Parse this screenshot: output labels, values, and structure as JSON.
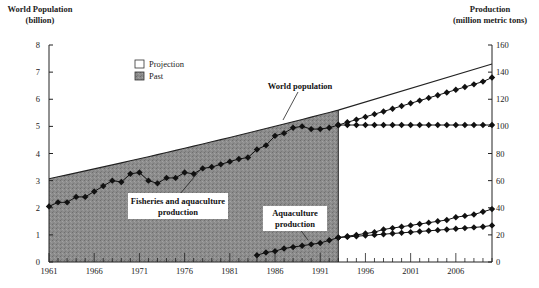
{
  "chart_data": {
    "type": "line",
    "title": "",
    "left_axis": {
      "label_line1": "World Population",
      "label_line2": "(billion)",
      "ticks": [
        "0",
        "1",
        "2",
        "3",
        "4",
        "5",
        "6",
        "7",
        "8"
      ],
      "ylim": [
        0,
        8
      ]
    },
    "right_axis": {
      "label_line1": "Production",
      "label_line2": "(million metric tons)",
      "ticks": [
        "0",
        "20",
        "40",
        "60",
        "80",
        "100",
        "120",
        "140",
        "160"
      ],
      "ylim": [
        0,
        160
      ]
    },
    "x_axis": {
      "tick_labels": [
        "1961",
        "1966",
        "1971",
        "1976",
        "1981",
        "1986",
        "1991",
        "1996",
        "2001",
        "2006"
      ],
      "xlim": [
        1961,
        2010
      ]
    },
    "legend": [
      {
        "label": "Projection",
        "swatch": "#ffffff"
      },
      {
        "label": "Past",
        "swatch": "#8a8a8a"
      }
    ],
    "past_region_end": 1993,
    "annotations": {
      "world_population": "World population",
      "fisheries_line1": "Fisheries and aquaculture",
      "fisheries_line2": "production",
      "aquaculture_line1": "Aquaculture",
      "aquaculture_line2": "production"
    },
    "series": [
      {
        "name": "World population (billion)",
        "axis": "left",
        "x": [
          1961,
          1993,
          2010
        ],
        "values": [
          3.07,
          5.6,
          7.3
        ]
      },
      {
        "name": "Fisheries and aquaculture production",
        "axis": "right",
        "x": [
          1961,
          1962,
          1963,
          1964,
          1965,
          1966,
          1967,
          1968,
          1969,
          1970,
          1971,
          1972,
          1973,
          1974,
          1975,
          1976,
          1977,
          1978,
          1979,
          1980,
          1981,
          1982,
          1983,
          1984,
          1985,
          1986,
          1987,
          1988,
          1989,
          1990,
          1991,
          1992,
          1993
        ],
        "values": [
          41,
          44,
          44,
          48,
          48,
          52,
          56,
          60,
          59,
          65,
          66,
          60,
          58,
          62,
          62,
          66,
          65,
          69,
          70,
          72,
          74,
          76,
          77,
          83,
          86,
          93,
          95,
          99,
          100,
          98,
          98,
          99,
          101
        ]
      },
      {
        "name": "Fisheries and aquaculture projection (high)",
        "axis": "right",
        "x": [
          1993,
          1994,
          1995,
          1996,
          1997,
          1998,
          1999,
          2000,
          2001,
          2002,
          2003,
          2004,
          2005,
          2006,
          2007,
          2008,
          2009,
          2010
        ],
        "values": [
          101,
          103,
          105,
          107,
          109,
          111,
          113,
          115,
          117,
          119,
          121,
          123,
          125,
          127,
          129,
          131,
          133,
          136
        ]
      },
      {
        "name": "Fisheries and aquaculture projection (flat)",
        "axis": "right",
        "x": [
          1993,
          1994,
          1995,
          1996,
          1997,
          1998,
          1999,
          2000,
          2001,
          2002,
          2003,
          2004,
          2005,
          2006,
          2007,
          2008,
          2009,
          2010
        ],
        "values": [
          101,
          101,
          101,
          101,
          101,
          101,
          101,
          101,
          101,
          101,
          101,
          101,
          101,
          101,
          101,
          101,
          101,
          101
        ]
      },
      {
        "name": "Aquaculture production",
        "axis": "right",
        "x": [
          1984,
          1985,
          1986,
          1987,
          1988,
          1989,
          1990,
          1991,
          1992,
          1993
        ],
        "values": [
          5,
          7,
          8,
          10,
          11,
          12,
          13,
          14,
          16,
          18
        ]
      },
      {
        "name": "Aquaculture projection (high)",
        "axis": "right",
        "x": [
          1993,
          1994,
          1995,
          1996,
          1997,
          1998,
          1999,
          2000,
          2001,
          2002,
          2003,
          2004,
          2005,
          2006,
          2007,
          2008,
          2009,
          2010
        ],
        "values": [
          18,
          19,
          20,
          21,
          22,
          24,
          25,
          26,
          27,
          28,
          29,
          30,
          31,
          33,
          34,
          35,
          37,
          39
        ]
      },
      {
        "name": "Aquaculture projection (low)",
        "axis": "right",
        "x": [
          1993,
          1994,
          1995,
          1996,
          1997,
          1998,
          1999,
          2000,
          2001,
          2002,
          2003,
          2004,
          2005,
          2006,
          2007,
          2008,
          2009,
          2010
        ],
        "values": [
          18,
          18.5,
          19,
          19.5,
          20,
          20.5,
          21,
          21.5,
          22,
          22.5,
          23,
          23.5,
          24,
          24.5,
          25,
          25.5,
          26,
          27
        ]
      }
    ]
  }
}
